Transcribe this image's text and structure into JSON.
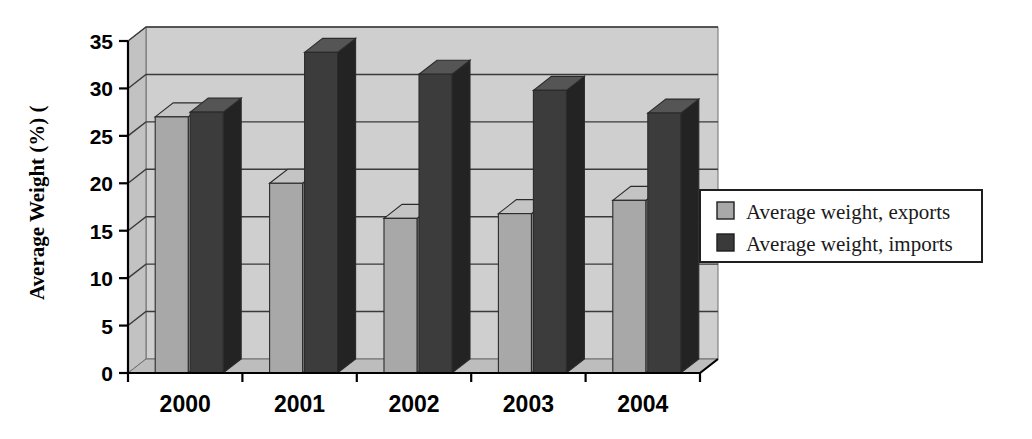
{
  "chart_data": {
    "type": "bar",
    "title": "",
    "subtitle": "",
    "xlabel": "",
    "ylabel": "Average Weight (%) (",
    "categories": [
      "2000",
      "2001",
      "2002",
      "2003",
      "2004"
    ],
    "series": [
      {
        "name": "Average weight, exports",
        "color": "#a8a8a8",
        "values": [
          27.0,
          20.0,
          16.3,
          16.8,
          18.2
        ]
      },
      {
        "name": "Average weight, imports",
        "color": "#3a3a3a",
        "values": [
          27.5,
          33.8,
          31.5,
          29.8,
          27.4
        ]
      }
    ],
    "ylim": [
      0,
      35
    ],
    "ytick_labels": [
      "0",
      "5",
      "10",
      "15",
      "20",
      "25",
      "30",
      "35"
    ],
    "ytick_values": [
      0,
      5,
      10,
      15,
      20,
      25,
      30,
      35
    ],
    "grid": true,
    "grid_axis": "y",
    "legend_position": "right",
    "style_3d": true,
    "plot_background": "#d0d0d0"
  },
  "legend": {
    "items": [
      {
        "label": "Average weight, exports",
        "swatch": "#a8a8a8"
      },
      {
        "label": "Average weight, imports",
        "swatch": "#3a3a3a"
      }
    ]
  },
  "colors": {
    "exports_front": "#a8a8a8",
    "exports_top": "#c4c4c4",
    "exports_side": "#8a8a8a",
    "imports_front": "#3c3c3c",
    "imports_top": "#555555",
    "imports_side": "#232323",
    "wall": "#cfcfcf",
    "floor": "#bdbdbd",
    "axis": "#000000"
  }
}
